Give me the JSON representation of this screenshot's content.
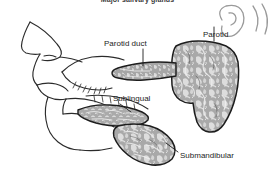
{
  "figure": {
    "title": "Major salivary glands",
    "background_color": "#ffffff",
    "line_color": "#1d1d1d",
    "gland_fill_color": "#a8a8a8",
    "gland_highlight_color": "#e8e8e8",
    "labels": [
      {
        "id": "parotid-duct",
        "text": "Parotid duct"
      },
      {
        "id": "parotid",
        "text": "Parotid"
      },
      {
        "id": "sublingual",
        "text": "Sublingual"
      },
      {
        "id": "submandibular",
        "text": "Submandibular"
      }
    ],
    "structures": [
      {
        "name": "face-profile",
        "description": "lateral view of nose, lips and chin in line art"
      },
      {
        "name": "ear",
        "description": "outer ear outline, upper right"
      },
      {
        "name": "parotid-gland",
        "description": "large mottled gray gland in front of and below the ear"
      },
      {
        "name": "parotid-duct",
        "description": "horizontal duct running forward across the cheek to the mouth"
      },
      {
        "name": "sublingual-gland",
        "description": "elongated almond shaped gland beneath the tongue"
      },
      {
        "name": "submandibular-gland",
        "description": "comma shaped gland beneath the jaw"
      }
    ]
  }
}
